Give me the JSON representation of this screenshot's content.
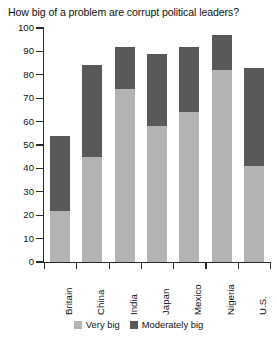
{
  "chart_data": {
    "type": "bar",
    "subtype": "stacked-column",
    "title": "How big of a problem are corrupt political leaders?",
    "xlabel": "",
    "ylabel": "",
    "ylim": [
      0,
      100
    ],
    "ytick_interval": 10,
    "yticks": [
      0,
      10,
      20,
      30,
      40,
      50,
      60,
      70,
      80,
      90,
      100
    ],
    "ytick_labels": [
      "0",
      "10",
      "20",
      "30",
      "40",
      "50",
      "60",
      "70",
      "80",
      "90",
      "100"
    ],
    "grid": false,
    "legend_position": "bottom-center",
    "categories": [
      "Britain",
      "China",
      "India",
      "Japan",
      "Mexico",
      "Nigeria",
      "U.S."
    ],
    "series": [
      {
        "name": "Very big",
        "color": "#b3b3b3",
        "values": [
          22,
          45,
          74,
          58,
          64,
          82,
          41
        ]
      },
      {
        "name": "Moderately big",
        "color": "#595959",
        "values": [
          32,
          39,
          18,
          31,
          28,
          15,
          42
        ]
      }
    ],
    "totals": [
      54,
      84,
      92,
      89,
      92,
      97,
      83
    ]
  },
  "legend": {
    "items": [
      {
        "label": "Very big",
        "color": "#b3b3b3",
        "swatch_name": "legend-swatch-very-big"
      },
      {
        "label": "Moderately big",
        "color": "#595959",
        "swatch_name": "legend-swatch-moderately-big"
      }
    ]
  },
  "axis": {
    "line_color": "#2b2b2b"
  }
}
